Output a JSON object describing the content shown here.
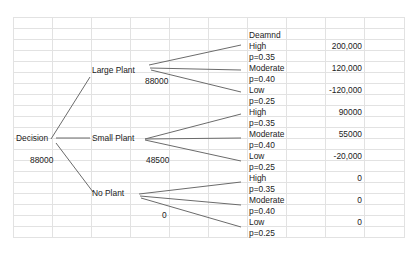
{
  "tree": {
    "root": {
      "label": "Decision",
      "value": "88000"
    },
    "demand_header": "Deamnd",
    "branches": [
      {
        "label": "Large Plant",
        "ev": "88000",
        "outcomes": [
          {
            "label": "High",
            "prob": "p=0.35",
            "payoff": "200,000"
          },
          {
            "label": "Moderate",
            "prob": "p=0.40",
            "payoff": "120,000"
          },
          {
            "label": "Low",
            "prob": "p=0.25",
            "payoff": "-120,000"
          }
        ]
      },
      {
        "label": "Small Plant",
        "ev": "48500",
        "outcomes": [
          {
            "label": "High",
            "prob": "p=0.35",
            "payoff": "90000"
          },
          {
            "label": "Moderate",
            "prob": "p=0.40",
            "payoff": "55000"
          },
          {
            "label": "Low",
            "prob": "p=0.25",
            "payoff": "-20,000"
          }
        ]
      },
      {
        "label": "No Plant",
        "ev": "0",
        "outcomes": [
          {
            "label": "High",
            "prob": "p=0.35",
            "payoff": "0"
          },
          {
            "label": "Moderate",
            "prob": "p=0.40",
            "payoff": "0"
          },
          {
            "label": "Low",
            "prob": "p=0.25",
            "payoff": "0"
          }
        ]
      }
    ]
  },
  "colors": {
    "line": "#6b6b6b",
    "grid": "#e2e2e2",
    "text": "#222222"
  }
}
